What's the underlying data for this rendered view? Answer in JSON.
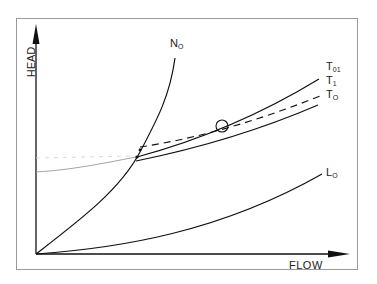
{
  "diagram": {
    "axes": {
      "y_label": "HEAD",
      "x_label": "FLOW"
    },
    "curves": [
      {
        "id": "N0",
        "label_main": "N",
        "label_sub": "O",
        "style": "solid"
      },
      {
        "id": "T01",
        "label_main": "T",
        "label_sub": "01",
        "style": "solid"
      },
      {
        "id": "T1",
        "label_main": "T",
        "label_sub": "1",
        "style": "dashed"
      },
      {
        "id": "T0",
        "label_main": "T",
        "label_sub": "O",
        "style": "solid"
      },
      {
        "id": "L0",
        "label_main": "L",
        "label_sub": "O",
        "style": "solid"
      }
    ],
    "marker": {
      "shape": "circle",
      "description": "operating point on T01/T1"
    },
    "colors": {
      "line": "#222222",
      "faint_line": "#9a9a9a",
      "frame": "#9a9a9a"
    }
  }
}
